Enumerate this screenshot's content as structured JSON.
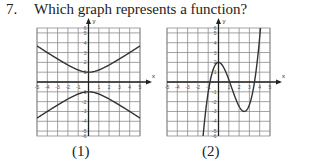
{
  "question": {
    "number": "7.",
    "text": "Which graph represents a function?"
  },
  "graphs": [
    {
      "caption": "(1)",
      "x_label": "x",
      "y_label": "y",
      "x_range": [
        -5,
        5
      ],
      "y_range": [
        -5.5,
        5.5
      ],
      "x_ticks": [
        "-5",
        "-4",
        "-3",
        "-2",
        "-1",
        "1",
        "2",
        "3",
        "4",
        "5"
      ],
      "y_ticks": [
        "6",
        "5",
        "4",
        "3",
        "2",
        "1",
        "-1",
        "-2",
        "-3",
        "-4",
        "-5",
        "-6"
      ],
      "curve": "hyperbola opening up/down: y = ±sqrt(1 + 0.5x²), vertices at (0, 1) and (0, -1)",
      "is_function": false
    },
    {
      "caption": "(2)",
      "x_label": "x",
      "y_label": "y",
      "x_range": [
        -5,
        5
      ],
      "y_range": [
        -5.5,
        5.5
      ],
      "x_ticks": [
        "-5",
        "-4",
        "-3",
        "-2",
        "-1",
        "1",
        "2",
        "3",
        "4",
        "5"
      ],
      "y_ticks": [
        "6",
        "5",
        "4",
        "3",
        "2",
        "1",
        "-1",
        "-2",
        "-3",
        "-4",
        "-5",
        "-6"
      ],
      "curve": "cubic with local max at (0, 2) and local min at about (2.5, -3)",
      "cubic_coefficients": {
        "a": 0.64,
        "b": -2.4,
        "c": 0,
        "d": 2
      },
      "is_function": true
    }
  ],
  "colors": {
    "grid": "#8a8a8a",
    "axis": "#222222",
    "curve": "#333333"
  }
}
